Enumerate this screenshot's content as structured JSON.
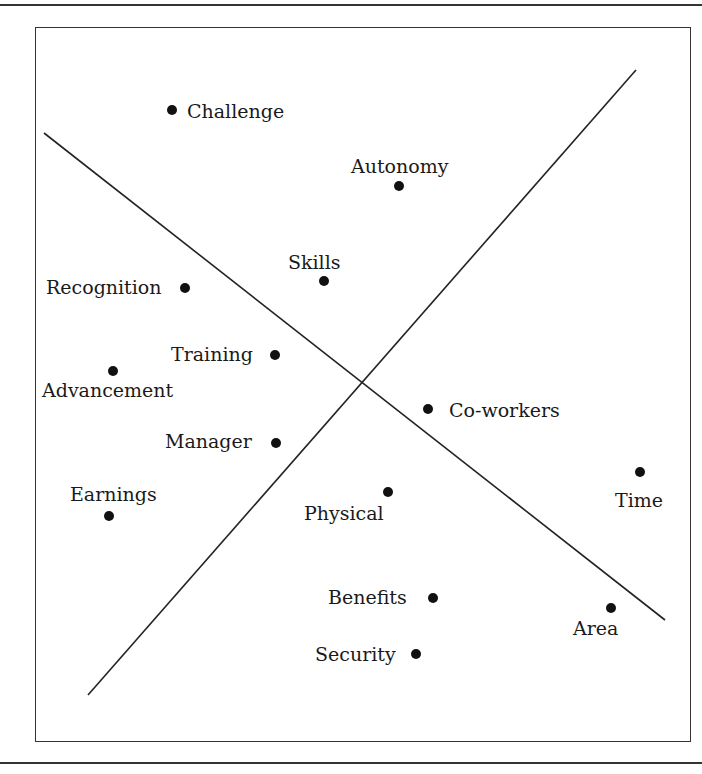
{
  "diagram": {
    "type": "perceptual-map",
    "frame": {
      "x": 35,
      "y": 27,
      "w": 656,
      "h": 715
    },
    "top_rule_y": 4,
    "bottom_rule_y": 762,
    "axes": [
      {
        "name": "descending-axis",
        "x1": 44,
        "y1": 133,
        "x2": 665,
        "y2": 620
      },
      {
        "name": "ascending-axis",
        "x1": 88,
        "y1": 695,
        "x2": 636,
        "y2": 70
      }
    ],
    "points": [
      {
        "id": "challenge",
        "label": "Challenge",
        "x": 172,
        "y": 110,
        "lx": 187,
        "ly": 102
      },
      {
        "id": "autonomy",
        "label": "Autonomy",
        "x": 399,
        "y": 186,
        "lx": 351,
        "ly": 157
      },
      {
        "id": "skills",
        "label": "Skills",
        "x": 324,
        "y": 281,
        "lx": 288,
        "ly": 253
      },
      {
        "id": "recognition",
        "label": "Recognition",
        "x": 185,
        "y": 288,
        "lx": 46,
        "ly": 278
      },
      {
        "id": "training",
        "label": "Training",
        "x": 275,
        "y": 355,
        "lx": 171,
        "ly": 345
      },
      {
        "id": "advancement",
        "label": "Advancement",
        "x": 113,
        "y": 371,
        "lx": 42,
        "ly": 381
      },
      {
        "id": "co-workers",
        "label": "Co-workers",
        "x": 428,
        "y": 409,
        "lx": 449,
        "ly": 401
      },
      {
        "id": "manager",
        "label": "Manager",
        "x": 276,
        "y": 443,
        "lx": 165,
        "ly": 432
      },
      {
        "id": "time",
        "label": "Time",
        "x": 640,
        "y": 472,
        "lx": 615,
        "ly": 491
      },
      {
        "id": "physical",
        "label": "Physical",
        "x": 388,
        "y": 492,
        "lx": 304,
        "ly": 504
      },
      {
        "id": "earnings",
        "label": "Earnings",
        "x": 109,
        "y": 516,
        "lx": 70,
        "ly": 485
      },
      {
        "id": "benefits",
        "label": "Benefits",
        "x": 433,
        "y": 598,
        "lx": 328,
        "ly": 588
      },
      {
        "id": "area",
        "label": "Area",
        "x": 611,
        "y": 608,
        "lx": 573,
        "ly": 619
      },
      {
        "id": "security",
        "label": "Security",
        "x": 416,
        "y": 654,
        "lx": 315,
        "ly": 645
      }
    ],
    "colors": {
      "line": "#222222",
      "point": "#111111",
      "frame": "#333333",
      "text": "#1a1a1a"
    }
  }
}
